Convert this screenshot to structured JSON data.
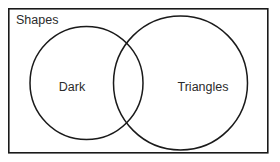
{
  "figure": {
    "type": "venn-diagram",
    "universe_label": "Shapes",
    "background_color": "#ffffff",
    "stroke_color": "#1a1a1a",
    "text_color": "#2b2b2b",
    "sets": [
      {
        "id": "left",
        "label": "Dark",
        "label_x": 72,
        "label_y": 88,
        "cx": 86.5,
        "cy": 83,
        "r": 56.5
      },
      {
        "id": "right",
        "label": "Triangles",
        "label_x": 203,
        "label_y": 88,
        "cx": 180.5,
        "cy": 83,
        "r": 67
      }
    ],
    "universe_rect": {
      "x": 8.8,
      "y": 8.8,
      "width": 259,
      "height": 144,
      "label_x": 16,
      "label_y": 24
    }
  }
}
